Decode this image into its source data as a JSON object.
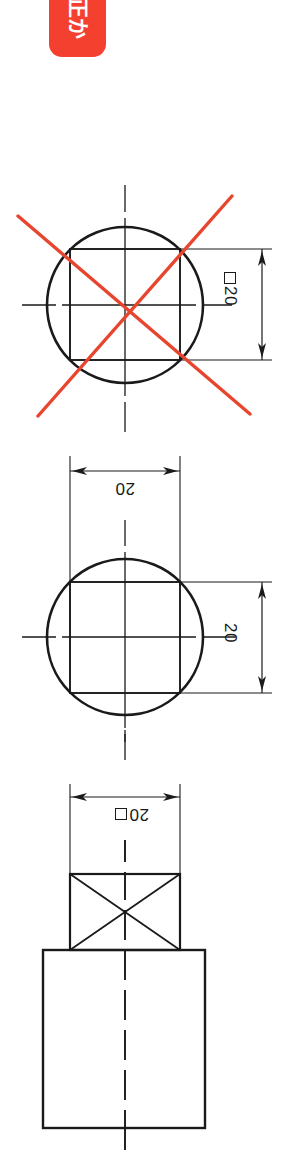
{
  "page": {
    "orientation": "rotated-90",
    "background_color": "#ffffff",
    "width": 288,
    "height": 1170
  },
  "badge": {
    "label": "正か",
    "background_color": "#f4402e",
    "text_color": "#ffffff"
  },
  "corner_note": {
    "text": "この"
  },
  "figures": [
    {
      "id": "figure-incorrect",
      "name": "circle-with-inscribed-square-incorrect",
      "status": "incorrect",
      "marked_wrong": true,
      "cross_color": "#e8452f",
      "dimensions": [
        {
          "id": "dim-vertical-sq20",
          "value": "20",
          "symbol": "square",
          "label": "□20",
          "orientation": "vertical"
        }
      ]
    },
    {
      "id": "figure-correct-two-dims",
      "name": "circle-with-inscribed-square-two-dimensions",
      "status": "correct",
      "marked_wrong": false,
      "dimensions": [
        {
          "id": "dim-horizontal-20",
          "value": "20",
          "symbol": "none",
          "label": "20",
          "orientation": "horizontal"
        },
        {
          "id": "dim-vertical-20",
          "value": "20",
          "symbol": "none",
          "label": "20",
          "orientation": "vertical"
        }
      ]
    },
    {
      "id": "figure-stepped-shaft",
      "name": "stepped-shaft-with-square-section",
      "status": "correct",
      "marked_wrong": false,
      "features": [
        "square-section-with-diagonals",
        "larger-rectangular-body"
      ],
      "dimensions": [
        {
          "id": "dim-square-sq20",
          "value": "20",
          "symbol": "square",
          "label": "□20",
          "orientation": "horizontal"
        }
      ]
    }
  ],
  "labels": {
    "dim_top_value": "20",
    "dim_mid_horizontal_value": "20",
    "dim_mid_vertical_value": "20",
    "dim_bottom_value": "20"
  },
  "colors": {
    "line": "#1a1a1a",
    "thin_line": "#333333",
    "red_accent": "#e8452f",
    "badge_red": "#f4402e"
  }
}
